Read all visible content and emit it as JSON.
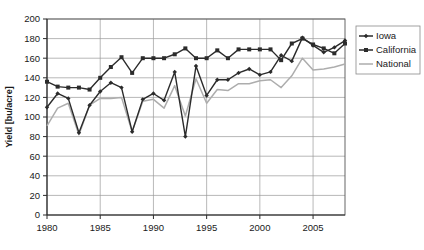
{
  "chart_data": {
    "type": "line",
    "title": "",
    "xlabel": "",
    "ylabel": "Yield [bu/acre]",
    "xlim": [
      1980,
      2008
    ],
    "ylim": [
      0,
      200
    ],
    "ytick_step": 20,
    "xtick_step": 5,
    "grid": true,
    "legend_position": "right",
    "x": [
      1980,
      1981,
      1982,
      1983,
      1984,
      1985,
      1986,
      1987,
      1988,
      1989,
      1990,
      1991,
      1992,
      1993,
      1994,
      1995,
      1996,
      1997,
      1998,
      1999,
      2000,
      2001,
      2002,
      2003,
      2004,
      2005,
      2006,
      2007,
      2008
    ],
    "xticks": [
      1980,
      1985,
      1990,
      1995,
      2000,
      2005
    ],
    "yticks": [
      0,
      20,
      40,
      60,
      80,
      100,
      120,
      140,
      160,
      180,
      200
    ],
    "series": [
      {
        "name": "Iowa",
        "color": "#2b2b2b",
        "marker": "diamond",
        "values": [
          110,
          124,
          119,
          84,
          112,
          126,
          135,
          130,
          85,
          118,
          124,
          117,
          146,
          80,
          152,
          122,
          138,
          138,
          145,
          149,
          143,
          146,
          163,
          157,
          181,
          173,
          166,
          171,
          178
        ]
      },
      {
        "name": "California",
        "color": "#2b2b2b",
        "marker": "square",
        "values": [
          136,
          131,
          130,
          130,
          128,
          140,
          151,
          161,
          145,
          160,
          160,
          160,
          164,
          170,
          160,
          160,
          168,
          160,
          169,
          169,
          169,
          169,
          158,
          175,
          180,
          174,
          170,
          165,
          175
        ]
      },
      {
        "name": "National",
        "color": "#adadad",
        "marker": "diamond",
        "values": [
          91,
          109,
          114,
          82,
          112,
          119,
          119,
          120,
          85,
          116,
          118,
          109,
          132,
          101,
          139,
          114,
          128,
          127,
          134,
          134,
          137,
          138,
          130,
          142,
          160,
          148,
          149,
          151,
          154
        ]
      }
    ]
  },
  "axis": {
    "y_title": "Yield [bu/acre]"
  },
  "legend": {
    "items": [
      {
        "label": "Iowa"
      },
      {
        "label": "California"
      },
      {
        "label": "National"
      }
    ]
  }
}
